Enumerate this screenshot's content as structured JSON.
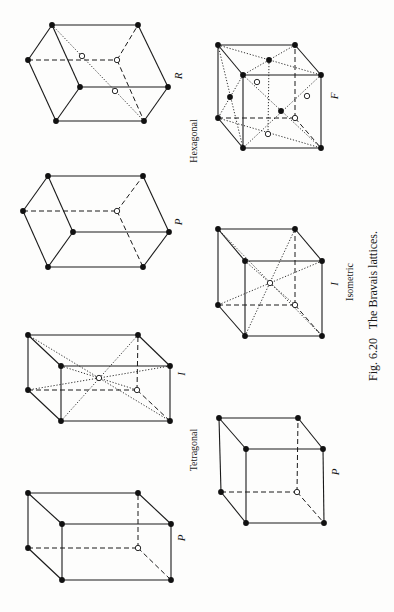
{
  "figure": {
    "caption": "Fig. 6.20   The Bravais lattices.",
    "caption_pos": {
      "x": 373,
      "y": 306
    },
    "orientation": "rotated-90-ccw",
    "groups": [
      {
        "name": "Hexagonal",
        "pos": {
          "x": 193,
          "y": 141
        }
      },
      {
        "name": "Tetragonal",
        "pos": {
          "x": 193,
          "y": 450
        }
      },
      {
        "name": "Isometric",
        "pos": {
          "x": 349,
          "y": 282
        }
      }
    ]
  },
  "lattices": [
    {
      "id": "hexagonal-R",
      "system": "Hexagonal",
      "label": "R",
      "label_pos": {
        "x": 178,
        "y": 76
      },
      "filled": [
        [
          52,
          25
        ],
        [
          138,
          25
        ],
        [
          28,
          60
        ],
        [
          80,
          87
        ],
        [
          168,
          87
        ],
        [
          56,
          121
        ],
        [
          144,
          121
        ]
      ],
      "hollow": [
        [
          117,
          60
        ],
        [
          82,
          56
        ],
        [
          115,
          91
        ]
      ],
      "solid": [
        [
          [
            52,
            25
          ],
          [
            138,
            25
          ]
        ],
        [
          [
            138,
            25
          ],
          [
            168,
            87
          ]
        ],
        [
          [
            52,
            25
          ],
          [
            28,
            60
          ]
        ],
        [
          [
            52,
            25
          ],
          [
            80,
            87
          ]
        ],
        [
          [
            28,
            60
          ],
          [
            56,
            121
          ]
        ],
        [
          [
            80,
            87
          ],
          [
            168,
            87
          ]
        ],
        [
          [
            80,
            87
          ],
          [
            56,
            121
          ]
        ],
        [
          [
            56,
            121
          ],
          [
            144,
            121
          ]
        ],
        [
          [
            168,
            87
          ],
          [
            144,
            121
          ]
        ]
      ],
      "dashed": [
        [
          [
            28,
            60
          ],
          [
            117,
            60
          ]
        ],
        [
          [
            117,
            60
          ],
          [
            138,
            25
          ]
        ],
        [
          [
            117,
            60
          ],
          [
            144,
            121
          ]
        ]
      ],
      "dotted": [
        [
          [
            52,
            25
          ],
          [
            144,
            121
          ]
        ]
      ]
    },
    {
      "id": "hexagonal-P",
      "system": "Hexagonal",
      "label": "P",
      "label_pos": {
        "x": 178,
        "y": 222
      },
      "filled": [
        [
          48,
          176
        ],
        [
          143,
          176
        ],
        [
          23,
          211
        ],
        [
          73,
          232
        ],
        [
          169,
          232
        ],
        [
          48,
          267
        ],
        [
          143,
          267
        ]
      ],
      "hollow": [
        [
          117,
          211
        ]
      ],
      "solid": [
        [
          [
            48,
            176
          ],
          [
            143,
            176
          ]
        ],
        [
          [
            143,
            176
          ],
          [
            169,
            232
          ]
        ],
        [
          [
            48,
            176
          ],
          [
            23,
            211
          ]
        ],
        [
          [
            48,
            176
          ],
          [
            73,
            232
          ]
        ],
        [
          [
            23,
            211
          ],
          [
            48,
            267
          ]
        ],
        [
          [
            73,
            232
          ],
          [
            169,
            232
          ]
        ],
        [
          [
            73,
            232
          ],
          [
            48,
            267
          ]
        ],
        [
          [
            48,
            267
          ],
          [
            143,
            267
          ]
        ],
        [
          [
            169,
            232
          ],
          [
            143,
            267
          ]
        ]
      ],
      "dashed": [
        [
          [
            23,
            211
          ],
          [
            117,
            211
          ]
        ],
        [
          [
            117,
            211
          ],
          [
            143,
            176
          ]
        ],
        [
          [
            117,
            211
          ],
          [
            143,
            267
          ]
        ]
      ],
      "dotted": []
    },
    {
      "id": "tetragonal-I",
      "system": "Tetragonal",
      "label": "I",
      "label_pos": {
        "x": 181,
        "y": 374
      },
      "filled": [
        [
          28,
          335
        ],
        [
          138,
          335
        ],
        [
          61,
          366
        ],
        [
          170,
          366
        ],
        [
          28,
          390
        ],
        [
          61,
          421
        ],
        [
          170,
          421
        ]
      ],
      "hollow": [
        [
          137,
          390
        ],
        [
          99,
          378
        ]
      ],
      "solid": [
        [
          [
            28,
            335
          ],
          [
            138,
            335
          ]
        ],
        [
          [
            138,
            335
          ],
          [
            170,
            366
          ]
        ],
        [
          [
            28,
            335
          ],
          [
            61,
            366
          ]
        ],
        [
          [
            61,
            366
          ],
          [
            170,
            366
          ]
        ],
        [
          [
            28,
            335
          ],
          [
            28,
            390
          ]
        ],
        [
          [
            61,
            366
          ],
          [
            61,
            421
          ]
        ],
        [
          [
            170,
            366
          ],
          [
            170,
            421
          ]
        ],
        [
          [
            28,
            390
          ],
          [
            61,
            421
          ]
        ],
        [
          [
            61,
            421
          ],
          [
            170,
            421
          ]
        ]
      ],
      "dashed": [
        [
          [
            28,
            390
          ],
          [
            137,
            390
          ]
        ],
        [
          [
            137,
            390
          ],
          [
            138,
            335
          ]
        ],
        [
          [
            137,
            390
          ],
          [
            170,
            421
          ]
        ]
      ],
      "dotted": [
        [
          [
            28,
            335
          ],
          [
            170,
            421
          ]
        ],
        [
          [
            138,
            335
          ],
          [
            61,
            421
          ]
        ],
        [
          [
            61,
            366
          ],
          [
            137,
            390
          ]
        ],
        [
          [
            170,
            366
          ],
          [
            28,
            390
          ]
        ]
      ]
    },
    {
      "id": "tetragonal-P",
      "system": "Tetragonal",
      "label": "P",
      "label_pos": {
        "x": 181,
        "y": 538
      },
      "filled": [
        [
          28,
          493
        ],
        [
          138,
          493
        ],
        [
          62,
          524
        ],
        [
          171,
          524
        ],
        [
          28,
          548
        ],
        [
          62,
          580
        ],
        [
          171,
          580
        ]
      ],
      "hollow": [
        [
          138,
          548
        ]
      ],
      "solid": [
        [
          [
            28,
            493
          ],
          [
            138,
            493
          ]
        ],
        [
          [
            138,
            493
          ],
          [
            171,
            524
          ]
        ],
        [
          [
            28,
            493
          ],
          [
            62,
            524
          ]
        ],
        [
          [
            62,
            524
          ],
          [
            171,
            524
          ]
        ],
        [
          [
            28,
            493
          ],
          [
            28,
            548
          ]
        ],
        [
          [
            62,
            524
          ],
          [
            62,
            580
          ]
        ],
        [
          [
            171,
            524
          ],
          [
            171,
            580
          ]
        ],
        [
          [
            28,
            548
          ],
          [
            62,
            580
          ]
        ],
        [
          [
            62,
            580
          ],
          [
            171,
            580
          ]
        ]
      ],
      "dashed": [
        [
          [
            28,
            548
          ],
          [
            138,
            548
          ]
        ],
        [
          [
            138,
            548
          ],
          [
            138,
            493
          ]
        ],
        [
          [
            138,
            548
          ],
          [
            171,
            580
          ]
        ]
      ],
      "dotted": []
    },
    {
      "id": "isometric-F",
      "system": "Isometric",
      "label": "F",
      "label_pos": {
        "x": 334,
        "y": 96
      },
      "filled": [
        [
          218,
          45
        ],
        [
          295,
          45
        ],
        [
          243,
          75
        ],
        [
          321,
          75
        ],
        [
          218,
          118
        ],
        [
          243,
          148
        ],
        [
          321,
          148
        ],
        [
          269,
          60
        ],
        [
          230,
          97
        ],
        [
          281,
          111
        ]
      ],
      "hollow": [
        [
          295,
          118
        ],
        [
          257,
          82
        ],
        [
          268,
          134
        ],
        [
          307,
          96
        ]
      ],
      "solid": [
        [
          [
            218,
            45
          ],
          [
            295,
            45
          ]
        ],
        [
          [
            295,
            45
          ],
          [
            321,
            75
          ]
        ],
        [
          [
            218,
            45
          ],
          [
            243,
            75
          ]
        ],
        [
          [
            243,
            75
          ],
          [
            321,
            75
          ]
        ],
        [
          [
            218,
            45
          ],
          [
            218,
            118
          ]
        ],
        [
          [
            243,
            75
          ],
          [
            243,
            148
          ]
        ],
        [
          [
            321,
            75
          ],
          [
            321,
            148
          ]
        ],
        [
          [
            218,
            118
          ],
          [
            243,
            148
          ]
        ],
        [
          [
            243,
            148
          ],
          [
            321,
            148
          ]
        ]
      ],
      "dashed": [
        [
          [
            218,
            118
          ],
          [
            295,
            118
          ]
        ],
        [
          [
            295,
            118
          ],
          [
            295,
            45
          ]
        ],
        [
          [
            295,
            118
          ],
          [
            321,
            148
          ]
        ]
      ],
      "dotted": [
        [
          [
            218,
            45
          ],
          [
            321,
            75
          ]
        ],
        [
          [
            295,
            45
          ],
          [
            243,
            75
          ]
        ],
        [
          [
            218,
            45
          ],
          [
            243,
            148
          ]
        ],
        [
          [
            243,
            75
          ],
          [
            218,
            118
          ]
        ],
        [
          [
            243,
            75
          ],
          [
            321,
            148
          ]
        ],
        [
          [
            321,
            75
          ],
          [
            243,
            148
          ]
        ],
        [
          [
            269,
            60
          ],
          [
            268,
            134
          ]
        ],
        [
          [
            218,
            118
          ],
          [
            321,
            148
          ]
        ]
      ]
    },
    {
      "id": "isometric-I",
      "system": "Isometric",
      "label": "I",
      "label_pos": {
        "x": 334,
        "y": 284
      },
      "filled": [
        [
          218,
          229
        ],
        [
          295,
          229
        ],
        [
          245,
          261
        ],
        [
          322,
          261
        ],
        [
          218,
          305
        ],
        [
          245,
          336
        ],
        [
          322,
          336
        ]
      ],
      "hollow": [
        [
          295,
          305
        ],
        [
          270,
          283
        ]
      ],
      "solid": [
        [
          [
            218,
            229
          ],
          [
            295,
            229
          ]
        ],
        [
          [
            295,
            229
          ],
          [
            322,
            261
          ]
        ],
        [
          [
            218,
            229
          ],
          [
            245,
            261
          ]
        ],
        [
          [
            245,
            261
          ],
          [
            322,
            261
          ]
        ],
        [
          [
            218,
            229
          ],
          [
            218,
            305
          ]
        ],
        [
          [
            245,
            261
          ],
          [
            245,
            336
          ]
        ],
        [
          [
            322,
            261
          ],
          [
            322,
            336
          ]
        ],
        [
          [
            218,
            305
          ],
          [
            245,
            336
          ]
        ],
        [
          [
            245,
            336
          ],
          [
            322,
            336
          ]
        ]
      ],
      "dashed": [
        [
          [
            218,
            305
          ],
          [
            295,
            305
          ]
        ],
        [
          [
            295,
            305
          ],
          [
            295,
            229
          ]
        ],
        [
          [
            295,
            305
          ],
          [
            322,
            336
          ]
        ]
      ],
      "dotted": [
        [
          [
            218,
            229
          ],
          [
            322,
            336
          ]
        ],
        [
          [
            295,
            229
          ],
          [
            245,
            336
          ]
        ],
        [
          [
            245,
            261
          ],
          [
            295,
            305
          ]
        ],
        [
          [
            322,
            261
          ],
          [
            218,
            305
          ]
        ]
      ]
    },
    {
      "id": "isometric-P",
      "system": "Isometric",
      "label": "P",
      "label_pos": {
        "x": 335,
        "y": 472
      },
      "filled": [
        [
          219,
          418
        ],
        [
          298,
          418
        ],
        [
          246,
          449
        ],
        [
          323,
          449
        ],
        [
          221,
          492
        ],
        [
          246,
          523
        ],
        [
          324,
          523
        ]
      ],
      "hollow": [
        [
          297,
          492
        ]
      ],
      "solid": [
        [
          [
            219,
            418
          ],
          [
            298,
            418
          ]
        ],
        [
          [
            298,
            418
          ],
          [
            323,
            449
          ]
        ],
        [
          [
            219,
            418
          ],
          [
            246,
            449
          ]
        ],
        [
          [
            246,
            449
          ],
          [
            323,
            449
          ]
        ],
        [
          [
            219,
            418
          ],
          [
            221,
            492
          ]
        ],
        [
          [
            246,
            449
          ],
          [
            246,
            523
          ]
        ],
        [
          [
            323,
            449
          ],
          [
            324,
            523
          ]
        ],
        [
          [
            221,
            492
          ],
          [
            246,
            523
          ]
        ],
        [
          [
            246,
            523
          ],
          [
            324,
            523
          ]
        ]
      ],
      "dashed": [
        [
          [
            221,
            492
          ],
          [
            297,
            492
          ]
        ],
        [
          [
            297,
            492
          ],
          [
            298,
            418
          ]
        ],
        [
          [
            297,
            492
          ],
          [
            324,
            523
          ]
        ]
      ],
      "dotted": []
    }
  ]
}
